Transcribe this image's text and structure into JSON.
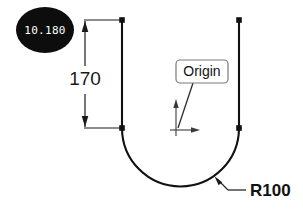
{
  "drawing": {
    "background_color": "#ffffff",
    "line_color": "#111111",
    "badge": {
      "value_label": "10.180",
      "fill_color": "#0d0d0d",
      "text_color": "#ffffff",
      "cx": 45,
      "cy": 30,
      "rx": 29,
      "ry": 23
    },
    "dimension": {
      "value_label": "170",
      "orientation": "vertical",
      "line_x": 85,
      "top_y": 20,
      "bottom_y": 128,
      "text_x": 85,
      "text_y": 84,
      "extension_end_x": 122
    },
    "radius_callout": {
      "value_label": "R100",
      "text_x": 250,
      "text_y": 196,
      "leader_from_x": 244,
      "leader_from_y": 190,
      "leader_mid_x": 228,
      "leader_mid_y": 190,
      "arrow_tip_x": 216,
      "arrow_tip_y": 178
    },
    "origin_callout": {
      "label": "Origin",
      "box_x": 176,
      "box_y": 60,
      "box_width": 52,
      "box_height": 23,
      "leader_to_x": 178,
      "leader_to_y": 128,
      "axis_x_label": "x-axis-arrow",
      "axis_y_label": "y-axis-arrow",
      "origin_x": 176,
      "origin_y": 130
    },
    "profile": {
      "left_line_x": 122,
      "right_line_x": 239,
      "top_y": 20,
      "tangent_y": 128,
      "arc_center_x": 180.5,
      "arc_center_y": 128,
      "arc_radius": 58.5,
      "node_points": [
        {
          "x": 122,
          "y": 20
        },
        {
          "x": 239,
          "y": 20
        },
        {
          "x": 122,
          "y": 128
        },
        {
          "x": 239,
          "y": 128
        }
      ]
    }
  }
}
